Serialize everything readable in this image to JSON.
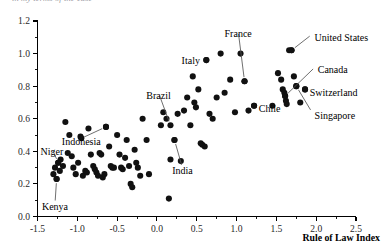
{
  "figure": {
    "clipped_top_title": "in my terms of the case",
    "background_color": "#ffffff",
    "point_color": "#111111",
    "axis_color": "#000000"
  },
  "chart_data": {
    "type": "scatter",
    "title": "",
    "xlabel": "Rule of Law Index",
    "ylabel": "",
    "xlim": [
      -1.5,
      2.5
    ],
    "ylim": [
      0.0,
      1.2
    ],
    "grid": false,
    "legend": "none",
    "x_ticks": [
      "-1.5",
      "-1.0",
      "-0.5",
      "0.0",
      "0.5",
      "1.0",
      "1.5",
      "2.0",
      "2.5"
    ],
    "x_tick_values": [
      -1.5,
      -1.0,
      -0.5,
      0.0,
      0.5,
      1.0,
      1.5,
      2.0,
      2.5
    ],
    "x_minor_count": 1,
    "y_ticks": [
      "0.0",
      "0.2",
      "0.4",
      "0.6",
      "0.8",
      "1.0",
      "1.2"
    ],
    "y_tick_values": [
      0.0,
      0.2,
      0.4,
      0.6,
      0.8,
      1.0,
      1.2
    ],
    "y_minor_count": 1,
    "points": [
      {
        "x": -1.3,
        "y": 0.26
      },
      {
        "x": -1.28,
        "y": 0.3
      },
      {
        "x": -1.26,
        "y": 0.23
      },
      {
        "x": -1.24,
        "y": 0.33
      },
      {
        "x": -1.22,
        "y": 0.28
      },
      {
        "x": -1.21,
        "y": 0.35
      },
      {
        "x": -1.18,
        "y": 0.31
      },
      {
        "x": -1.15,
        "y": 0.58
      },
      {
        "x": -1.12,
        "y": 0.39
      },
      {
        "x": -1.1,
        "y": 0.5
      },
      {
        "x": -1.07,
        "y": 0.37
      },
      {
        "x": -1.05,
        "y": 0.3
      },
      {
        "x": -1.02,
        "y": 0.26
      },
      {
        "x": -0.99,
        "y": 0.33
      },
      {
        "x": -0.96,
        "y": 0.49
      },
      {
        "x": -0.95,
        "y": 0.48
      },
      {
        "x": -0.93,
        "y": 0.25
      },
      {
        "x": -0.9,
        "y": 0.28
      },
      {
        "x": -0.88,
        "y": 0.27
      },
      {
        "x": -0.86,
        "y": 0.54
      },
      {
        "x": -0.83,
        "y": 0.38
      },
      {
        "x": -0.8,
        "y": 0.31
      },
      {
        "x": -0.78,
        "y": 0.29
      },
      {
        "x": -0.76,
        "y": 0.27
      },
      {
        "x": -0.74,
        "y": 0.25
      },
      {
        "x": -0.72,
        "y": 0.39
      },
      {
        "x": -0.7,
        "y": 0.38
      },
      {
        "x": -0.68,
        "y": 0.24
      },
      {
        "x": -0.66,
        "y": 0.26
      },
      {
        "x": -0.64,
        "y": 0.55
      },
      {
        "x": -0.6,
        "y": 0.43
      },
      {
        "x": -0.58,
        "y": 0.31
      },
      {
        "x": -0.56,
        "y": 0.3
      },
      {
        "x": -0.54,
        "y": 0.3
      },
      {
        "x": -0.5,
        "y": 0.5
      },
      {
        "x": -0.47,
        "y": 0.38
      },
      {
        "x": -0.45,
        "y": 0.3
      },
      {
        "x": -0.43,
        "y": 0.29
      },
      {
        "x": -0.4,
        "y": 0.36
      },
      {
        "x": -0.38,
        "y": 0.47
      },
      {
        "x": -0.35,
        "y": 0.31
      },
      {
        "x": -0.33,
        "y": 0.2
      },
      {
        "x": -0.31,
        "y": 0.18
      },
      {
        "x": -0.28,
        "y": 0.41
      },
      {
        "x": -0.26,
        "y": 0.33
      },
      {
        "x": -0.24,
        "y": 0.3
      },
      {
        "x": -0.21,
        "y": 0.25
      },
      {
        "x": -0.18,
        "y": 0.6
      },
      {
        "x": -0.13,
        "y": 0.47
      },
      {
        "x": -0.1,
        "y": 0.26
      },
      {
        "x": 0.05,
        "y": 0.56
      },
      {
        "x": 0.08,
        "y": 0.64
      },
      {
        "x": 0.12,
        "y": 0.6
      },
      {
        "x": 0.15,
        "y": 0.11
      },
      {
        "x": 0.17,
        "y": 0.35
      },
      {
        "x": 0.22,
        "y": 0.47
      },
      {
        "x": 0.26,
        "y": 0.63
      },
      {
        "x": 0.3,
        "y": 0.34
      },
      {
        "x": 0.34,
        "y": 0.65
      },
      {
        "x": 0.38,
        "y": 0.73
      },
      {
        "x": 0.42,
        "y": 0.56
      },
      {
        "x": 0.45,
        "y": 0.86
      },
      {
        "x": 0.47,
        "y": 0.7
      },
      {
        "x": 0.49,
        "y": 0.67
      },
      {
        "x": 0.52,
        "y": 0.78
      },
      {
        "x": 0.55,
        "y": 0.45
      },
      {
        "x": 0.57,
        "y": 0.44
      },
      {
        "x": 0.6,
        "y": 0.43
      },
      {
        "x": 0.62,
        "y": 0.96
      },
      {
        "x": 0.66,
        "y": 0.63
      },
      {
        "x": 0.7,
        "y": 0.6
      },
      {
        "x": 0.75,
        "y": 0.73
      },
      {
        "x": 0.8,
        "y": 1.0
      },
      {
        "x": 0.85,
        "y": 0.76
      },
      {
        "x": 0.92,
        "y": 0.84
      },
      {
        "x": 0.98,
        "y": 0.64
      },
      {
        "x": 1.05,
        "y": 1.0
      },
      {
        "x": 1.1,
        "y": 0.83
      },
      {
        "x": 1.15,
        "y": 0.65
      },
      {
        "x": 1.22,
        "y": 0.68
      },
      {
        "x": 1.45,
        "y": 0.68
      },
      {
        "x": 1.52,
        "y": 0.88
      },
      {
        "x": 1.56,
        "y": 0.84
      },
      {
        "x": 1.58,
        "y": 0.78
      },
      {
        "x": 1.6,
        "y": 0.76
      },
      {
        "x": 1.61,
        "y": 0.74
      },
      {
        "x": 1.62,
        "y": 0.71
      },
      {
        "x": 1.63,
        "y": 0.69
      },
      {
        "x": 1.66,
        "y": 1.02
      },
      {
        "x": 1.69,
        "y": 1.02
      },
      {
        "x": 1.72,
        "y": 0.86
      },
      {
        "x": 1.75,
        "y": 0.8
      },
      {
        "x": 1.8,
        "y": 0.7
      },
      {
        "x": 1.86,
        "y": 0.78
      }
    ],
    "annotations": [
      {
        "label": "United States",
        "label_x": 1.98,
        "label_y": 1.1,
        "anchor": "start",
        "leader": true,
        "point_x": 1.69,
        "point_y": 1.02
      },
      {
        "label": "France",
        "label_x": 1.02,
        "label_y": 1.12,
        "anchor": "middle",
        "leader": true,
        "point_x": 1.1,
        "point_y": 0.83
      },
      {
        "label": "Italy",
        "label_x": 0.54,
        "label_y": 0.96,
        "anchor": "end",
        "leader": false,
        "point_x": 0.62,
        "point_y": 0.96
      },
      {
        "label": "Canada",
        "label_x": 2.02,
        "label_y": 0.9,
        "anchor": "start",
        "leader": true,
        "point_x": 1.61,
        "point_y": 0.74
      },
      {
        "label": "Switzerland",
        "label_x": 1.92,
        "label_y": 0.76,
        "anchor": "start",
        "leader": false,
        "point_x": 1.86,
        "point_y": 0.78
      },
      {
        "label": "Singapore",
        "label_x": 1.98,
        "label_y": 0.62,
        "anchor": "start",
        "leader": true,
        "point_x": 1.75,
        "point_y": 0.8
      },
      {
        "label": "Chile",
        "label_x": 1.28,
        "label_y": 0.66,
        "anchor": "start",
        "leader": false,
        "point_x": 1.22,
        "point_y": 0.68
      },
      {
        "label": "Brazil",
        "label_x": 0.02,
        "label_y": 0.74,
        "anchor": "middle",
        "leader": true,
        "point_x": 0.17,
        "point_y": 0.56
      },
      {
        "label": "Indonesia",
        "label_x": -0.95,
        "label_y": 0.46,
        "anchor": "middle",
        "leader": true,
        "point_x": -0.64,
        "point_y": 0.55
      },
      {
        "label": "Niger",
        "label_x": -1.32,
        "label_y": 0.4,
        "anchor": "middle",
        "leader": true,
        "point_x": -1.24,
        "point_y": 0.33
      },
      {
        "label": "India",
        "label_x": 0.32,
        "label_y": 0.28,
        "anchor": "middle",
        "leader": true,
        "point_x": 0.22,
        "point_y": 0.47
      },
      {
        "label": "Kenya",
        "label_x": -1.28,
        "label_y": 0.06,
        "anchor": "middle",
        "leader": true,
        "point_x": -1.26,
        "point_y": 0.23
      }
    ]
  }
}
